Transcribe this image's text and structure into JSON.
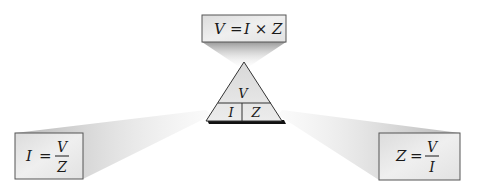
{
  "diagram": {
    "triangle": {
      "top": "V",
      "bottom_left": "I",
      "bottom_right": "Z"
    },
    "formulas": {
      "top": {
        "lhs": "V",
        "eq": "=",
        "rhs": "I × Z"
      },
      "left": {
        "lhs": "I",
        "eq": "=",
        "num": "V",
        "den": "Z"
      },
      "right": {
        "lhs": "Z",
        "eq": "=",
        "num": "V",
        "den": "I"
      }
    },
    "colors": {
      "box_fill": "#e6e6e6",
      "box_border": "#555555",
      "beam": "#bdbdbd",
      "triangle_fill": "#e3e3e3",
      "shadow": "#111111"
    }
  }
}
